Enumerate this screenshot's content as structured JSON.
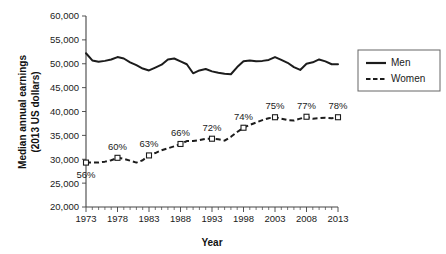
{
  "chart_data": {
    "type": "line",
    "title": "",
    "xlabel": "Year",
    "ylabel": "Median annual earnings (2013 US dollars)",
    "ylabel_line1": "Median annual earnings",
    "ylabel_line2": "(2013 US dollars)",
    "xlim": [
      1973,
      2013
    ],
    "ylim": [
      20000,
      60000
    ],
    "grid": false,
    "legend_position": "right",
    "y_ticks": [
      20000,
      25000,
      30000,
      35000,
      40000,
      45000,
      50000,
      55000,
      60000
    ],
    "y_tick_labels": [
      "20,000",
      "25,000",
      "30,000",
      "35,000",
      "40,000",
      "45,000",
      "50,000",
      "55,000",
      "60,000"
    ],
    "x_ticks": [
      1973,
      1978,
      1983,
      1988,
      1993,
      1998,
      2003,
      2008,
      2013
    ],
    "x_tick_labels": [
      "1973",
      "1978",
      "1983",
      "1988",
      "1993",
      "1998",
      "2003",
      "2008",
      "2013"
    ],
    "x_minor_ticks": [
      1974,
      1975,
      1976,
      1977,
      1979,
      1980,
      1981,
      1982,
      1984,
      1985,
      1986,
      1987,
      1989,
      1990,
      1991,
      1992,
      1994,
      1995,
      1996,
      1997,
      1999,
      2000,
      2001,
      2002,
      2004,
      2005,
      2006,
      2007,
      2009,
      2010,
      2011,
      2012
    ],
    "x": [
      1973,
      1974,
      1975,
      1976,
      1977,
      1978,
      1979,
      1980,
      1981,
      1982,
      1983,
      1984,
      1985,
      1986,
      1987,
      1988,
      1989,
      1990,
      1991,
      1992,
      1993,
      1994,
      1995,
      1996,
      1997,
      1998,
      1999,
      2000,
      2001,
      2002,
      2003,
      2004,
      2005,
      2006,
      2007,
      2008,
      2009,
      2010,
      2011,
      2012,
      2013
    ],
    "series": [
      {
        "name": "Men",
        "style": "solid",
        "markers": false,
        "values": [
          52200,
          50700,
          50400,
          50600,
          50900,
          51400,
          51100,
          50300,
          49700,
          49000,
          48600,
          49200,
          49800,
          50900,
          51100,
          50500,
          49900,
          48000,
          48600,
          48900,
          48400,
          48100,
          47900,
          47800,
          49300,
          50500,
          50700,
          50500,
          50600,
          50800,
          51400,
          50800,
          50200,
          49300,
          48700,
          50000,
          50300,
          50900,
          50500,
          49900,
          49900
        ]
      },
      {
        "name": "Women",
        "style": "dashed",
        "markers": true,
        "values": [
          29300,
          29300,
          29300,
          29500,
          29800,
          30300,
          30100,
          29700,
          29300,
          29800,
          30800,
          31300,
          31900,
          32300,
          32700,
          33200,
          33800,
          33800,
          34000,
          34300,
          34300,
          34200,
          33900,
          34700,
          35700,
          36600,
          37200,
          37700,
          38200,
          38600,
          38800,
          38500,
          38200,
          38100,
          38500,
          38900,
          38500,
          38600,
          38700,
          38600,
          38800
        ]
      }
    ],
    "annotations": [
      {
        "year": 1973,
        "value": 29300,
        "label": "56%",
        "placement": "below"
      },
      {
        "year": 1978,
        "value": 30300,
        "label": "60%",
        "placement": "above"
      },
      {
        "year": 1983,
        "value": 30800,
        "label": "63%",
        "placement": "above"
      },
      {
        "year": 1988,
        "value": 33200,
        "label": "66%",
        "placement": "above"
      },
      {
        "year": 1993,
        "value": 34300,
        "label": "72%",
        "placement": "above"
      },
      {
        "year": 1998,
        "value": 36600,
        "label": "74%",
        "placement": "above"
      },
      {
        "year": 2003,
        "value": 38800,
        "label": "75%",
        "placement": "above"
      },
      {
        "year": 2008,
        "value": 38900,
        "label": "77%",
        "placement": "above"
      },
      {
        "year": 2013,
        "value": 38800,
        "label": "78%",
        "placement": "above"
      }
    ],
    "marker_years": [
      1973,
      1978,
      1983,
      1988,
      1993,
      1998,
      2003,
      2008,
      2013
    ],
    "legend": [
      {
        "label": "Men",
        "style": "solid"
      },
      {
        "label": "Women",
        "style": "dashed"
      }
    ],
    "colors": {
      "men_line": "#1c1c1c",
      "women_line": "#1c1c1c",
      "axis": "#444444",
      "text": "#1a1a1a",
      "background": "#ffffff",
      "marker_fill": "#ffffff"
    }
  }
}
